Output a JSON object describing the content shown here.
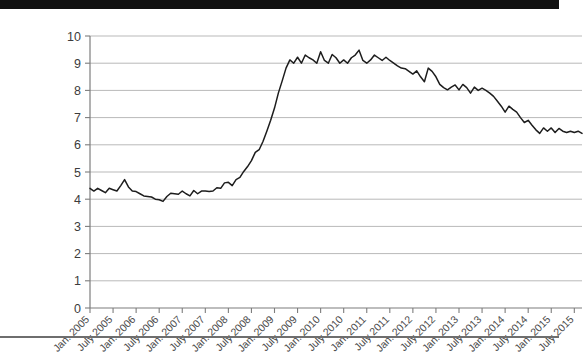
{
  "chart_data": {
    "type": "line",
    "title": "",
    "subtitle": "",
    "xlabel": "",
    "ylabel": "",
    "ylim": [
      0,
      10
    ],
    "yticks": [
      0,
      1,
      2,
      3,
      4,
      5,
      6,
      7,
      8,
      9,
      10
    ],
    "ytick_labels": [
      "0",
      "1",
      "2",
      "3",
      "4",
      "5",
      "6",
      "7",
      "8",
      "9",
      "10"
    ],
    "grid": true,
    "grid_axis": "y",
    "legend": false,
    "legend_position": "none",
    "annotations": [],
    "line_color": "#1d1d1d",
    "grid_color": "#b9b9b9",
    "axis_color": "#7d7d7d",
    "xtick_labels": [
      "Jan. 2005",
      "July 2005",
      "Jan. 2006",
      "July 2006",
      "Jan. 2007",
      "July 2007",
      "Jan. 2008",
      "July 2008",
      "Jan. 2009",
      "July 2009",
      "Jan. 2010",
      "July 2010",
      "Jan. 2011",
      "July 2011",
      "Jan. 2012",
      "July 2012",
      "Jan. 2013",
      "July 2013",
      "Jan. 2014",
      "July 2014",
      "Jan. 2015",
      "July 2015"
    ],
    "x": [
      "2005-01",
      "2005-02",
      "2005-03",
      "2005-04",
      "2005-05",
      "2005-06",
      "2005-07",
      "2005-08",
      "2005-09",
      "2005-10",
      "2005-11",
      "2005-12",
      "2006-01",
      "2006-02",
      "2006-03",
      "2006-04",
      "2006-05",
      "2006-06",
      "2006-07",
      "2006-08",
      "2006-09",
      "2006-10",
      "2006-11",
      "2006-12",
      "2007-01",
      "2007-02",
      "2007-03",
      "2007-04",
      "2007-05",
      "2007-06",
      "2007-07",
      "2007-08",
      "2007-09",
      "2007-10",
      "2007-11",
      "2007-12",
      "2008-01",
      "2008-02",
      "2008-03",
      "2008-04",
      "2008-05",
      "2008-06",
      "2008-07",
      "2008-08",
      "2008-09",
      "2008-10",
      "2008-11",
      "2008-12",
      "2009-01",
      "2009-02",
      "2009-03",
      "2009-04",
      "2009-05",
      "2009-06",
      "2009-07",
      "2009-08",
      "2009-09",
      "2009-10",
      "2009-11",
      "2009-12",
      "2010-01",
      "2010-02",
      "2010-03",
      "2010-04",
      "2010-05",
      "2010-06",
      "2010-07",
      "2010-08",
      "2010-09",
      "2010-10",
      "2010-11",
      "2010-12",
      "2011-01",
      "2011-02",
      "2011-03",
      "2011-04",
      "2011-05",
      "2011-06",
      "2011-07",
      "2011-08",
      "2011-09",
      "2011-10",
      "2011-11",
      "2011-12",
      "2012-01",
      "2012-02",
      "2012-03",
      "2012-04",
      "2012-05",
      "2012-06",
      "2012-07",
      "2012-08",
      "2012-09",
      "2012-10",
      "2012-11",
      "2012-12",
      "2013-01",
      "2013-02",
      "2013-03",
      "2013-04",
      "2013-05",
      "2013-06",
      "2013-07",
      "2013-08",
      "2013-09",
      "2013-10",
      "2013-11",
      "2013-12",
      "2014-01",
      "2014-02",
      "2014-03",
      "2014-04",
      "2014-05",
      "2014-06",
      "2014-07",
      "2014-08",
      "2014-09",
      "2014-10",
      "2014-11",
      "2014-12",
      "2015-01",
      "2015-02",
      "2015-03",
      "2015-04",
      "2015-05",
      "2015-06",
      "2015-07",
      "2015-08",
      "2015-09"
    ],
    "values": [
      4.4,
      4.3,
      4.4,
      4.3,
      4.2,
      4.4,
      4.3,
      4.3,
      4.5,
      4.7,
      4.4,
      4.3,
      4.3,
      4.2,
      4.1,
      4.1,
      4.1,
      4.0,
      4.0,
      3.9,
      4.1,
      4.2,
      4.2,
      4.2,
      4.3,
      4.2,
      4.1,
      4.3,
      4.2,
      4.3,
      4.3,
      4.3,
      4.3,
      4.4,
      4.4,
      4.6,
      4.6,
      4.5,
      4.7,
      4.8,
      5.0,
      5.2,
      5.4,
      5.7,
      5.8,
      6.1,
      6.5,
      6.9,
      7.3,
      7.9,
      8.3,
      8.8,
      9.1,
      9.0,
      9.2,
      9.0,
      9.3,
      9.2,
      9.1,
      9.0,
      9.4,
      9.1,
      9.0,
      9.3,
      9.2,
      9.0,
      9.1,
      9.0,
      9.2,
      9.3,
      9.5,
      9.1,
      9.0,
      9.1,
      9.3,
      9.2,
      9.1,
      9.2,
      9.1,
      9.0,
      8.9,
      8.8,
      8.8,
      8.7,
      8.6,
      8.7,
      8.5,
      8.3,
      8.8,
      8.7,
      8.5,
      8.2,
      8.1,
      8.0,
      8.1,
      8.2,
      8.0,
      8.2,
      8.1,
      7.9,
      8.1,
      8.0,
      8.1,
      8.0,
      7.9,
      7.8,
      7.6,
      7.4,
      7.2,
      7.4,
      7.3,
      7.2,
      7.0,
      6.8,
      6.9,
      6.7,
      6.5,
      6.4,
      6.3,
      6.4,
      6.3,
      6.2,
      6.3,
      6.2,
      6.1,
      6.0,
      6.1,
      6.0,
      5.9
    ],
    "display_values": [
      4.4,
      4.3,
      4.4,
      4.32,
      4.24,
      4.4,
      4.35,
      4.3,
      4.5,
      4.72,
      4.45,
      4.3,
      4.28,
      4.2,
      4.12,
      4.1,
      4.08,
      4.0,
      3.98,
      3.92,
      4.1,
      4.22,
      4.2,
      4.18,
      4.3,
      4.2,
      4.12,
      4.32,
      4.2,
      4.3,
      4.3,
      4.28,
      4.3,
      4.42,
      4.4,
      4.6,
      4.62,
      4.5,
      4.72,
      4.8,
      5.02,
      5.2,
      5.42,
      5.72,
      5.82,
      6.12,
      6.5,
      6.9,
      7.35,
      7.9,
      8.35,
      8.82,
      9.12,
      9.0,
      9.22,
      9.0,
      9.3,
      9.2,
      9.12,
      9.0,
      9.42,
      9.1,
      9.0,
      9.32,
      9.2,
      9.0,
      9.12,
      9.0,
      9.2,
      9.3,
      9.48,
      9.1,
      9.0,
      9.12,
      9.3,
      9.2,
      9.1,
      9.22,
      9.1,
      9.0,
      8.9,
      8.82,
      8.8,
      8.7,
      8.6,
      8.72,
      8.5,
      8.32,
      8.82,
      8.7,
      8.5,
      8.22,
      8.1,
      8.02,
      8.12,
      8.2,
      8.02,
      8.22,
      8.1,
      7.9,
      8.12,
      8.0,
      8.08,
      8.0,
      7.9,
      7.78,
      7.6,
      7.42,
      7.2,
      7.42,
      7.3,
      7.2,
      7.0,
      6.82,
      6.9,
      6.72,
      6.55,
      6.42,
      6.62,
      6.5,
      6.62,
      6.45,
      6.6,
      6.5,
      6.45,
      6.5,
      6.45,
      6.5,
      6.42
    ]
  }
}
